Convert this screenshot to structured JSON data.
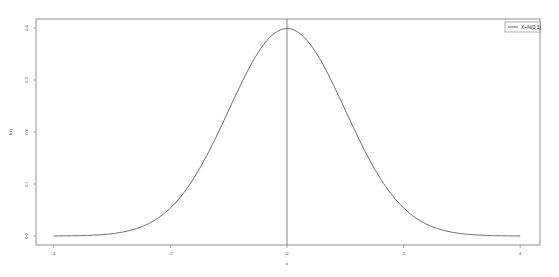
{
  "chart_data": {
    "type": "line",
    "title": "",
    "xlabel": "x",
    "ylabel": "f(x)",
    "xlim": [
      -4,
      4
    ],
    "ylim": [
      0,
      0.4
    ],
    "x_ticks": [
      -4,
      -2,
      0,
      2,
      4
    ],
    "x_tick_labels": [
      "-4",
      "-2",
      "0",
      "2",
      "4"
    ],
    "y_ticks": [
      0.0,
      0.1,
      0.2,
      0.3,
      0.4
    ],
    "y_tick_labels": [
      "0.0",
      "0.1",
      "0.2",
      "0.3",
      "0.4"
    ],
    "grid": false,
    "legend_position": "upper right",
    "vertical_reference_line": 0,
    "series": [
      {
        "name": "X~N(0,1)",
        "color": "#555555",
        "distribution": "normal",
        "mean": 0,
        "sd": 1,
        "x": [
          -4,
          -3.5,
          -3,
          -2.5,
          -2,
          -1.5,
          -1,
          -0.5,
          0,
          0.5,
          1,
          1.5,
          2,
          2.5,
          3,
          3.5,
          4
        ],
        "values": [
          0.0001,
          0.0009,
          0.0044,
          0.0175,
          0.054,
          0.1295,
          0.242,
          0.3521,
          0.3989,
          0.3521,
          0.242,
          0.1295,
          0.054,
          0.0175,
          0.0044,
          0.0009,
          0.0001
        ]
      }
    ]
  },
  "legend": {
    "entries": [
      "X~N(0,1)"
    ]
  },
  "colors": {
    "frame": "#777777",
    "curve": "#555555",
    "vline": "#666666"
  }
}
